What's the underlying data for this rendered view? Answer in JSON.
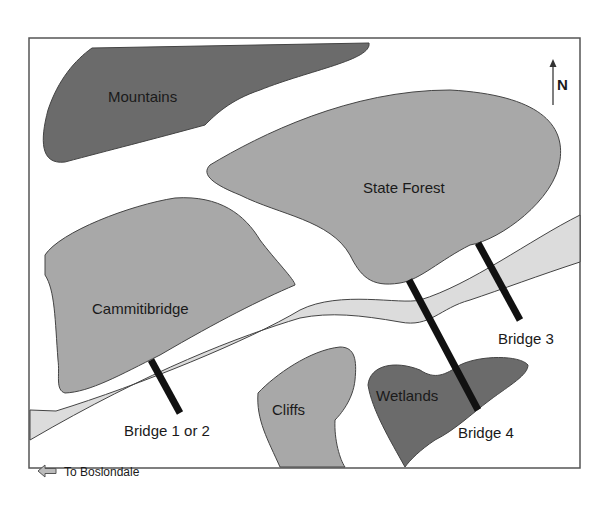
{
  "map": {
    "colors": {
      "background": "#ffffff",
      "frame": "#555555",
      "dark_region": "#6b6b6b",
      "medium_region": "#a8a8a8",
      "river": "#dcdcdc",
      "bridge": "#111111",
      "outline": "#444444"
    },
    "regions": [
      {
        "name": "Mountains",
        "shade": "dark"
      },
      {
        "name": "State Forest",
        "shade": "medium"
      },
      {
        "name": "Cammitibridge",
        "shade": "medium"
      },
      {
        "name": "Cliffs",
        "shade": "medium"
      },
      {
        "name": "Wetlands",
        "shade": "dark"
      }
    ],
    "bridges": [
      {
        "label": "Bridge 1 or 2"
      },
      {
        "label": "Bridge 3"
      },
      {
        "label": "Bridge 4"
      }
    ],
    "compass": {
      "label": "N"
    },
    "direction_note": {
      "icon": "left-arrow-icon",
      "label": "To Boslondale"
    }
  }
}
